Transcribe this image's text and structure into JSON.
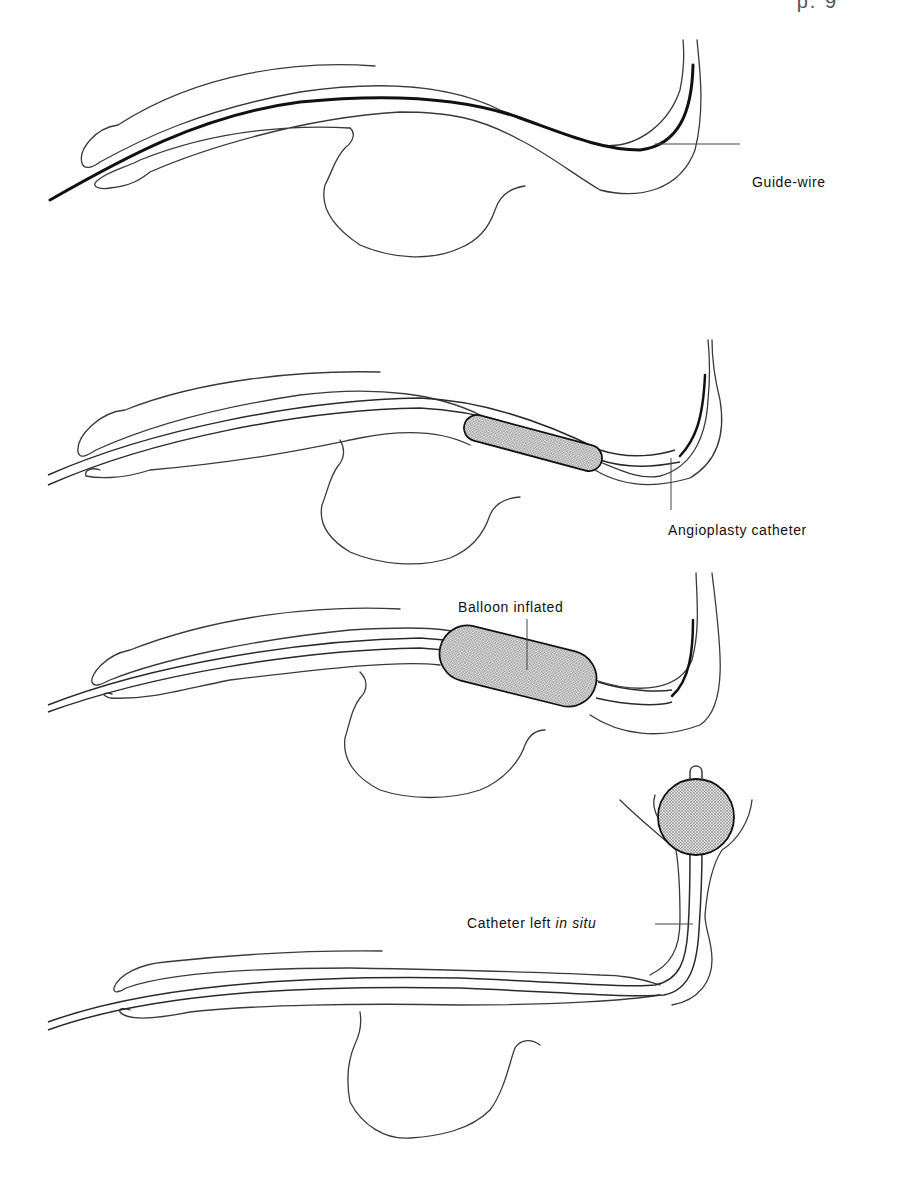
{
  "page_header": {
    "text": "p. 9"
  },
  "figure": {
    "panels": [
      {
        "id": "panel-1",
        "stage": "guide-wire inserted",
        "label": "Guide-wire"
      },
      {
        "id": "panel-2",
        "stage": "catheter advanced over wire",
        "label": "Angioplasty catheter"
      },
      {
        "id": "panel-3",
        "stage": "balloon inflated",
        "label": "Balloon inflated"
      },
      {
        "id": "panel-4",
        "stage": "catheter retained",
        "label_prefix": "Catheter left ",
        "label_italic": "in situ"
      }
    ]
  },
  "colors": {
    "line": "#3a3a3a",
    "wire": "#111111",
    "balloon_fill": "#bdbdbd",
    "background": "#ffffff"
  }
}
